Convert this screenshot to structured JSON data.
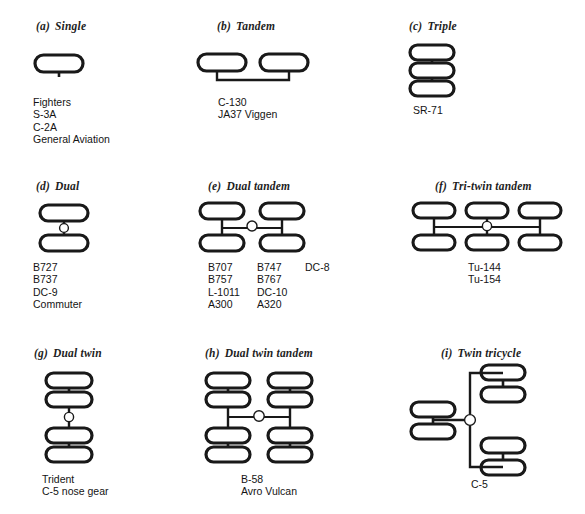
{
  "figure": {
    "kind": "landing-gear-configuration-chart",
    "background_color": "#ffffff",
    "ink_color": "#191919"
  },
  "panels": [
    {
      "id": "a",
      "label": "(a)",
      "name": "Single",
      "caption_x": 36,
      "caption_y": 20,
      "diagram_x": 30,
      "diagram_y": 48,
      "list_x": 33,
      "list_y": 96,
      "columns": [
        {
          "items": [
            "Fighters",
            "S-3A",
            "C-2A",
            "General Aviation"
          ]
        }
      ]
    },
    {
      "id": "b",
      "label": "(b)",
      "name": "Tandem",
      "caption_x": 217,
      "caption_y": 20,
      "diagram_x": 194,
      "diagram_y": 48,
      "list_x": 218,
      "list_y": 96,
      "columns": [
        {
          "items": [
            "C-130",
            "JA37 Viggen"
          ]
        }
      ]
    },
    {
      "id": "c",
      "label": "(c)",
      "name": "Triple",
      "caption_x": 409,
      "caption_y": 20,
      "diagram_x": 406,
      "diagram_y": 42,
      "list_x": 413,
      "list_y": 104,
      "columns": [
        {
          "items": [
            "SR-71"
          ]
        }
      ]
    },
    {
      "id": "d",
      "label": "(d)",
      "name": "Dual",
      "caption_x": 36,
      "caption_y": 180,
      "diagram_x": 36,
      "diagram_y": 202,
      "list_x": 33,
      "list_y": 261,
      "columns": [
        {
          "items": [
            "B727",
            "B737",
            "DC-9",
            "Commuter"
          ]
        }
      ]
    },
    {
      "id": "e",
      "label": "(e)",
      "name": "Dual tandem",
      "caption_x": 208,
      "caption_y": 180,
      "diagram_x": 196,
      "diagram_y": 199,
      "list_x": 208,
      "list_y": 261,
      "columns": [
        {
          "items": [
            "B707",
            "B757",
            "L-1011",
            "A300"
          ]
        },
        {
          "items": [
            "B747",
            "B767",
            "DC-10",
            "A320"
          ]
        },
        {
          "items": [
            "DC-8"
          ]
        }
      ]
    },
    {
      "id": "f",
      "label": "(f)",
      "name": "Tri-twin tandem",
      "caption_x": 435,
      "caption_y": 180,
      "diagram_x": 410,
      "diagram_y": 199,
      "list_x": 468,
      "list_y": 261,
      "columns": [
        {
          "items": [
            "Tu-144",
            "Tu-154"
          ]
        }
      ]
    },
    {
      "id": "g",
      "label": "(g)",
      "name": "Dual twin",
      "caption_x": 34,
      "caption_y": 347,
      "diagram_x": 42,
      "diagram_y": 370,
      "list_x": 42,
      "list_y": 473,
      "columns": [
        {
          "items": [
            "Trident",
            "C-5 nose gear"
          ]
        }
      ]
    },
    {
      "id": "h",
      "label": "(h)",
      "name": "Dual twin tandem",
      "caption_x": 205,
      "caption_y": 347,
      "diagram_x": 202,
      "diagram_y": 370,
      "list_x": 241,
      "list_y": 473,
      "columns": [
        {
          "items": [
            "B-58",
            "Avro Vulcan"
          ]
        }
      ]
    },
    {
      "id": "i",
      "label": "(i)",
      "name": "Twin tricycle",
      "caption_x": 441,
      "caption_y": 347,
      "diagram_x": 408,
      "diagram_y": 362,
      "list_x": 471,
      "list_y": 478,
      "columns": [
        {
          "items": [
            "C-5"
          ]
        }
      ]
    }
  ]
}
